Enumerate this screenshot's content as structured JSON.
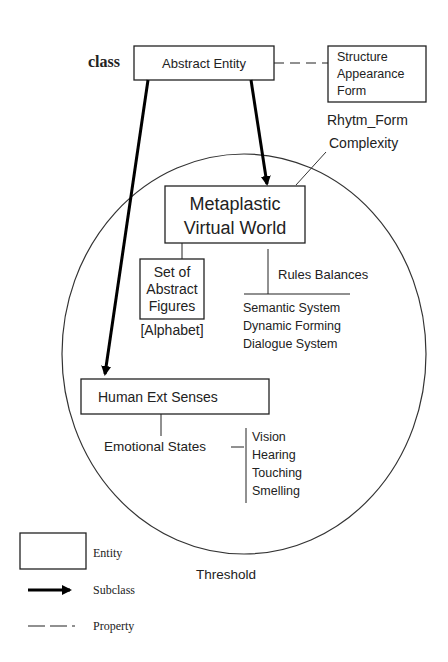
{
  "diagram": {
    "class_label": "class",
    "abstract_entity": "Abstract Entity",
    "properties_box": [
      "Structure",
      "Appearance",
      "Form"
    ],
    "rhythm_form": "Rhytm_Form",
    "complexity": "Complexity",
    "metaplastic": [
      "Metaplastic",
      "Virtual World"
    ],
    "abstract_figures": [
      "Set of",
      "Abstract",
      "Figures"
    ],
    "alphabet": "[Alphabet]",
    "rules_balances": "Rules Balances",
    "systems": [
      "Semantic System",
      "Dynamic Forming",
      "Dialogue System"
    ],
    "human_senses": "Human Ext Senses",
    "emotional_states": "Emotional States",
    "senses": [
      "Vision",
      "Hearing",
      "Touching",
      "Smelling"
    ],
    "threshold": "Threshold"
  },
  "legend": {
    "entity": "Entity",
    "subclass": "Subclass",
    "property": "Property"
  }
}
